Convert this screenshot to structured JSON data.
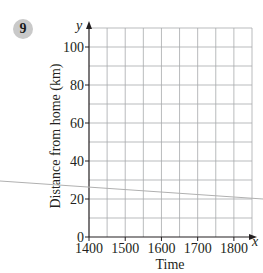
{
  "question": {
    "number": "9"
  },
  "chart_data": {
    "type": "line",
    "title": "",
    "xlabel": "Time",
    "ylabel": "Distance from home (km)",
    "x_axis_var": "x",
    "y_axis_var": "y",
    "x_ticks": [
      "1400",
      "1500",
      "1600",
      "1700",
      "1800"
    ],
    "y_ticks": [
      "0",
      "20",
      "40",
      "60",
      "80",
      "100"
    ],
    "xlim": [
      1400,
      1850
    ],
    "ylim": [
      0,
      110
    ],
    "x_minor_step": 50,
    "y_minor_step": 10,
    "grid": true,
    "legend": null,
    "series": []
  },
  "colors": {
    "grid": "#a7a9ac",
    "axis": "#231f20",
    "badge": "#c9c9c9",
    "stray_line": "#b0b0b0"
  }
}
